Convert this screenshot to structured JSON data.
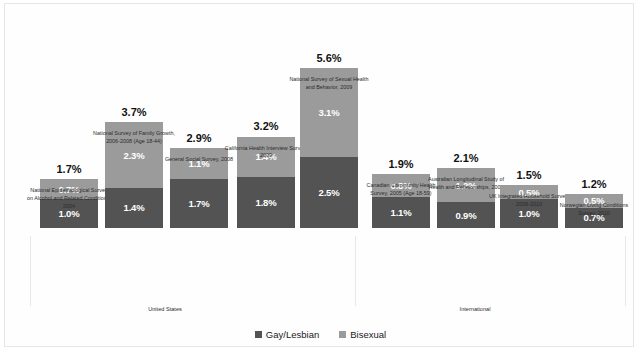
{
  "chart_data": {
    "type": "bar",
    "subtype": "stacked-bar",
    "title": "",
    "xlabel": "",
    "ylabel": "",
    "ylim": [
      0,
      5.6
    ],
    "grid": false,
    "legend_position": "bottom",
    "value_suffix": "%",
    "categories": [
      "National Epidemiological Survey on Alcohol and Related Conditions, 2004",
      "National Survey of Family Growth, 2006-2008 (Age 18-44)",
      "General Social Survey, 2008",
      "California Health Interview Survey, 2009",
      "National Survey of Sexual Health and Behavior, 2009",
      "Canadian Community Health Survey, 2005 (Age 18-59)",
      "Australian Longitudinal Study of Health and Relationships, 2005",
      "UK Integrated Household Survey, 2009-2010",
      "Norwegian Living Conditions Survey, 2010"
    ],
    "series": [
      {
        "name": "Gay/Lesbian",
        "color": "#535353",
        "values": [
          1.0,
          1.4,
          1.7,
          1.8,
          2.5,
          1.1,
          0.9,
          1.0,
          0.7
        ]
      },
      {
        "name": "Bisexual",
        "color": "#9b9b9b",
        "values": [
          0.7,
          2.3,
          1.1,
          1.4,
          3.1,
          0.8,
          1.2,
          0.5,
          0.5
        ]
      }
    ],
    "totals": [
      1.7,
      3.7,
      2.9,
      3.2,
      5.6,
      1.9,
      2.1,
      1.5,
      1.2
    ],
    "groups": [
      {
        "label": "United States",
        "categories": [
          0,
          1,
          2,
          3,
          4
        ]
      },
      {
        "label": "International",
        "categories": [
          5,
          6,
          7,
          8
        ]
      }
    ]
  },
  "bars": [
    {
      "total": "1.7%",
      "gay": "1.0%",
      "bisexual": "0.7%",
      "label": "National Epidemiological Survey on Alcohol and Related Conditions, 2004"
    },
    {
      "total": "3.7%",
      "gay": "1.4%",
      "bisexual": "2.3%",
      "label": "National Survey of Family Growth, 2006-2008 (Age 18-44)"
    },
    {
      "total": "2.9%",
      "gay": "1.7%",
      "bisexual": "1.1%",
      "label": "General Social Survey, 2008"
    },
    {
      "total": "3.2%",
      "gay": "1.8%",
      "bisexual": "1.4%",
      "label": "California Health Interview Survey, 2009"
    },
    {
      "total": "5.6%",
      "gay": "2.5%",
      "bisexual": "3.1%",
      "label": "National Survey of Sexual Health and Behavior, 2009"
    },
    {
      "total": "1.9%",
      "gay": "1.1%",
      "bisexual": "0.8%",
      "label": "Canadian Community Health Survey, 2005 (Age 18-59)"
    },
    {
      "total": "2.1%",
      "gay": "0.9%",
      "bisexual": "1.2%",
      "label": "Australian Longitudinal Study of Health and Relationships, 2005"
    },
    {
      "total": "1.5%",
      "gay": "1.0%",
      "bisexual": "0.5%",
      "label": "UK Integrated Household Survey, 2009-2010"
    },
    {
      "total": "1.2%",
      "gay": "0.7%",
      "bisexual": "0.5%",
      "label": "Norwegian Living Conditions Survey, 2010"
    }
  ],
  "groups": {
    "united_states": "United States",
    "international": "International"
  },
  "legend": {
    "items": [
      {
        "label": "Gay/Lesbian",
        "color": "#535353"
      },
      {
        "label": "Bisexual",
        "color": "#9b9b9b"
      }
    ]
  }
}
